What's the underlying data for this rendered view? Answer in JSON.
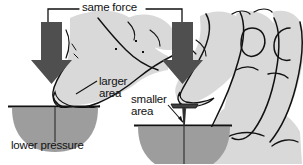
{
  "figure": {
    "background_color": "#ffffff",
    "labels": {
      "same_force": "same force",
      "larger_area": "larger\narea",
      "smaller_area": "smaller\narea",
      "lower_pressure": "lower pressure"
    },
    "colors": {
      "arrow": "#4f4f4f",
      "hand_fill": "#d9d9d9",
      "dome_fill": "#9d9d9d",
      "outline": "#111111",
      "text": "#111111",
      "surface_line": "#111111"
    },
    "elements": {
      "left_scene": {
        "name": "thumb-pressing-flat-on-surface",
        "arrow": "down-arrow",
        "contact": "large-contact-area",
        "result": "lower pressure"
      },
      "right_scene": {
        "name": "thumb-pressing-on-tack",
        "arrow": "down-arrow",
        "contact": "small-contact-area",
        "tool": "thumbtack-pin"
      },
      "bracket": {
        "name": "same-force-bracket",
        "spans": "both arrows"
      }
    }
  }
}
